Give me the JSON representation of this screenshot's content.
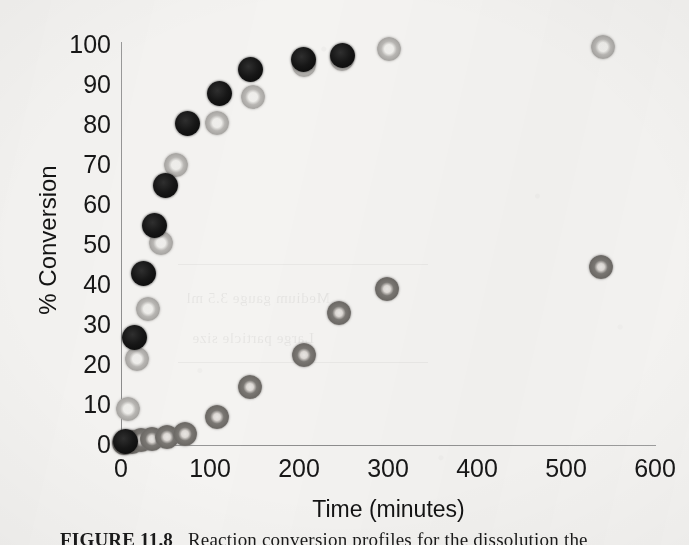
{
  "figure": {
    "caption_label": "FIGURE 11.8",
    "caption_text": "Reaction conversion profiles for the dissolution the"
  },
  "axes": {
    "y_title": "% Conversion",
    "x_title": "Time (minutes)",
    "y_ticks": [
      "100",
      "90",
      "80",
      "70",
      "60",
      "50",
      "40",
      "30",
      "20",
      "10",
      "0"
    ],
    "x_ticks": [
      "0",
      "100",
      "200",
      "300",
      "400",
      "500",
      "600"
    ]
  },
  "ghost": {
    "line1": "Medium gauge 3.5 ml",
    "line2": "Large particle size"
  },
  "colors": {
    "background": "#f4f3f1",
    "axis": "#8e8e8e",
    "text": "#171717",
    "series_dark": "#141414",
    "series_open": "#bdbbb8",
    "series_mid": "#74716d"
  },
  "chart_data": {
    "type": "scatter",
    "title": "",
    "xlabel": "Time (minutes)",
    "ylabel": "% Conversion",
    "xlim": [
      0,
      600
    ],
    "ylim": [
      0,
      100
    ],
    "xticks": [
      0,
      100,
      200,
      300,
      400,
      500,
      600
    ],
    "yticks": [
      0,
      10,
      20,
      30,
      40,
      50,
      60,
      70,
      80,
      90,
      100
    ],
    "grid": false,
    "legend": "none",
    "series": [
      {
        "name": "Fast series (solid dark markers)",
        "marker": "filled-circle",
        "color": "#141414",
        "points": [
          {
            "x": 5,
            "y": 1
          },
          {
            "x": 15,
            "y": 27
          },
          {
            "x": 25,
            "y": 43
          },
          {
            "x": 38,
            "y": 55
          },
          {
            "x": 50,
            "y": 65
          },
          {
            "x": 75,
            "y": 80.5
          },
          {
            "x": 110,
            "y": 88
          },
          {
            "x": 145,
            "y": 94
          },
          {
            "x": 205,
            "y": 96.5
          },
          {
            "x": 248,
            "y": 97.5
          }
        ]
      },
      {
        "name": "Intermediate series (open light markers)",
        "marker": "open-circle",
        "color": "#bdbbb8",
        "points": [
          {
            "x": 8,
            "y": 9
          },
          {
            "x": 18,
            "y": 21.5
          },
          {
            "x": 30,
            "y": 34
          },
          {
            "x": 45,
            "y": 50.5
          },
          {
            "x": 62,
            "y": 70
          },
          {
            "x": 108,
            "y": 80.5
          },
          {
            "x": 148,
            "y": 87
          },
          {
            "x": 205,
            "y": 95
          },
          {
            "x": 248,
            "y": 96.5
          },
          {
            "x": 300,
            "y": 99
          },
          {
            "x": 540,
            "y": 99.5
          }
        ]
      },
      {
        "name": "Slow series (medium gray markers)",
        "marker": "donut-circle",
        "color": "#74716d",
        "points": [
          {
            "x": 3,
            "y": 0.5
          },
          {
            "x": 12,
            "y": 0.8
          },
          {
            "x": 22,
            "y": 1.2
          },
          {
            "x": 35,
            "y": 1.5
          },
          {
            "x": 52,
            "y": 2
          },
          {
            "x": 72,
            "y": 2.8
          },
          {
            "x": 108,
            "y": 7
          },
          {
            "x": 145,
            "y": 14.5
          },
          {
            "x": 205,
            "y": 22.5
          },
          {
            "x": 245,
            "y": 33
          },
          {
            "x": 298,
            "y": 39
          },
          {
            "x": 538,
            "y": 44.5
          }
        ]
      }
    ]
  }
}
